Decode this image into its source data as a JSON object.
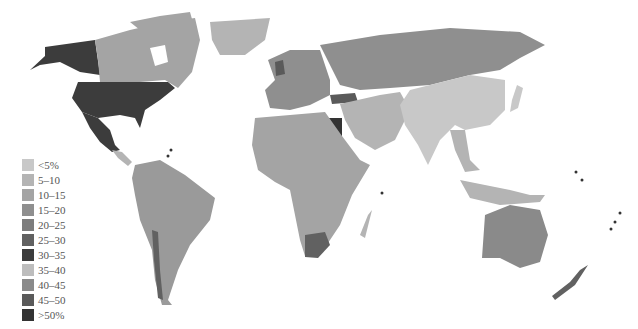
{
  "legend": {
    "items": [
      {
        "label": "<5%",
        "color": "#c8c8c8"
      },
      {
        "label": "5–10",
        "color": "#b4b4b4"
      },
      {
        "label": "10–15",
        "color": "#a4a4a4"
      },
      {
        "label": "15–20",
        "color": "#8f8f8f"
      },
      {
        "label": "20–25",
        "color": "#7d7d7d"
      },
      {
        "label": "25–30",
        "color": "#616161"
      },
      {
        "label": "30–35",
        "color": "#3c3c3c"
      },
      {
        "label": "35–40",
        "color": "#bdbdbd"
      },
      {
        "label": "40–45",
        "color": "#8a8a8a"
      },
      {
        "label": "45–50",
        "color": "#5a5a5a"
      },
      {
        "label": ">50%",
        "color": "#333333"
      }
    ]
  },
  "regions": {
    "usa": "#3c3c3c",
    "alaska": "#3c3c3c",
    "mexico": "#3c3c3c",
    "canada": "#a4a4a4",
    "greenland": "#b4b4b4",
    "central_america": "#b4b4b4",
    "south_america": "#9a9a9a",
    "europe": "#8f8f8f",
    "russia": "#8f8f8f",
    "middle_east": "#b4b4b4",
    "egypt": "#333333",
    "turkey": "#5a5a5a",
    "africa": "#a4a4a4",
    "south_africa": "#616161",
    "china_india": "#c8c8c8",
    "southeast_asia": "#b4b4b4",
    "australia": "#8a8a8a",
    "new_zealand": "#616161"
  }
}
